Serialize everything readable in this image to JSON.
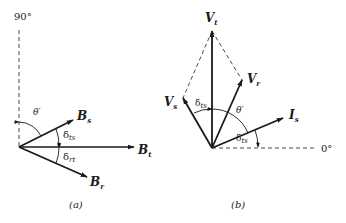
{
  "figure_a": {
    "caption": "(a)",
    "axis_label_90": "90°",
    "vectors": [
      {
        "name": "B",
        "sub": "s"
      },
      {
        "name": "B",
        "sub": "t"
      },
      {
        "name": "B",
        "sub": "r"
      }
    ],
    "angles": {
      "theta": "θ′",
      "delta_ts": {
        "sym": "δ",
        "sub": "ts"
      },
      "delta_rt": {
        "sym": "δ",
        "sub": "rt"
      }
    }
  },
  "figure_b": {
    "caption": "(b)",
    "axis_label_0": "0°",
    "vectors": [
      {
        "name": "V",
        "sub": "t"
      },
      {
        "name": "V",
        "sub": "r"
      },
      {
        "name": "V",
        "sub": "s"
      },
      {
        "name": "I",
        "sub": "s"
      }
    ],
    "angles": {
      "delta_ts_upper": {
        "sym": "δ",
        "sub": "ts"
      },
      "theta": "θ′",
      "delta_ts_lower": {
        "sym": "δ",
        "sub": "ts"
      }
    }
  },
  "colors": {
    "ink": "#1a1a1a",
    "background": "#ffffff"
  }
}
